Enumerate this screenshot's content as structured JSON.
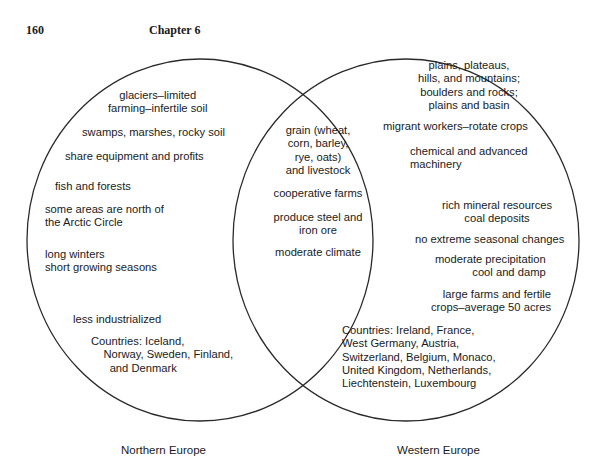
{
  "header": {
    "page_number": "160",
    "chapter": "Chapter 6"
  },
  "diagram": {
    "type": "venn",
    "left_set": {
      "label": "Northern Europe",
      "items": [
        "glaciers–limited\nfarming–infertile soil",
        "swamps, marshes, rocky soil",
        "share equipment and profits",
        "fish and forests",
        "some areas are north of\nthe Arctic Circle",
        "long winters\nshort growing seasons",
        "less industrialized",
        "Countries: Iceland,\n    Norway, Sweden, Finland,\n      and Denmark"
      ]
    },
    "overlap": {
      "items": [
        "grain (wheat,\ncorn, barley,\nrye, oats)\nand livestock",
        "cooperative farms",
        "produce steel and\niron ore",
        "moderate climate"
      ]
    },
    "right_set": {
      "label": "Western Europe",
      "items": [
        "plains, plateaus,\nhills, and mountains;\nboulders and rocks;\nplains and basin",
        "migrant workers–rotate crops",
        "chemical and advanced\nmachinery",
        "rich mineral resources\ncoal deposits",
        "no extreme seasonal changes",
        "moderate precipitation\ncool and damp",
        "large farms and fertile\ncrops–average 50 acres",
        "Countries: Ireland, France,\nWest Germany, Austria,\nSwitzerland, Belgium, Monaco,\nUnited Kingdom, Netherlands,\nLiechtenstein, Luxembourg"
      ]
    },
    "line_color": "#2a2a2a"
  }
}
